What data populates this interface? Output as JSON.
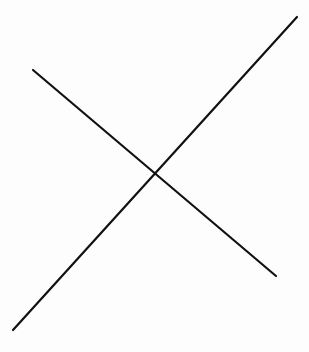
{
  "diagram": {
    "type": "intersecting-lines",
    "background_color": "#fdfdfd",
    "stroke_color": "#111111",
    "stroke_width": 2.2,
    "lines": [
      {
        "id": "line-a",
        "x1": 33,
        "y1": 70,
        "x2": 276,
        "y2": 276
      },
      {
        "id": "line-b",
        "x1": 297,
        "y1": 17,
        "x2": 13,
        "y2": 330
      }
    ],
    "intersection": {
      "x": 154,
      "y": 175
    }
  }
}
